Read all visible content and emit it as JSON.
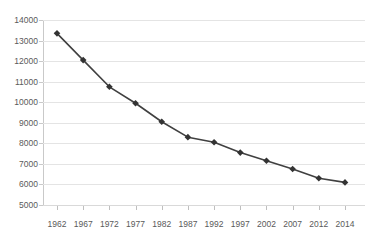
{
  "chart_data": {
    "type": "line",
    "title": "",
    "subtitle": "",
    "xlabel": "",
    "ylabel": "",
    "categories": [
      "1962",
      "1967",
      "1972",
      "1977",
      "1982",
      "1987",
      "1992",
      "1997",
      "2002",
      "2007",
      "2012",
      "2014"
    ],
    "x": [
      1962,
      1967,
      1972,
      1977,
      1982,
      1987,
      1992,
      1997,
      2002,
      2007,
      2012,
      2014
    ],
    "values": [
      13350,
      12050,
      10750,
      9950,
      9050,
      8300,
      8050,
      7550,
      7150,
      6750,
      6300,
      6100
    ],
    "series": [
      {
        "name": "",
        "values": [
          13350,
          12050,
          10750,
          9950,
          9050,
          8300,
          8050,
          7550,
          7150,
          6750,
          6300,
          6100
        ]
      }
    ],
    "ylim": [
      5000,
      14000
    ],
    "yticks": [
      5000,
      6000,
      7000,
      8000,
      9000,
      10000,
      11000,
      12000,
      13000,
      14000
    ],
    "ytick_labels": [
      "5000",
      "6000",
      "7000",
      "8000",
      "9000",
      "10000",
      "11000",
      "12000",
      "13000",
      "14000"
    ],
    "grid": true,
    "legend": false,
    "legend_position": "none",
    "marker": "diamond",
    "line_color": "#404040",
    "marker_color": "#333333",
    "grid_color": "#e4e4e4",
    "axis_color": "#c9c9c9",
    "text_color": "#5a5a5a",
    "background_color": "#ffffff"
  }
}
